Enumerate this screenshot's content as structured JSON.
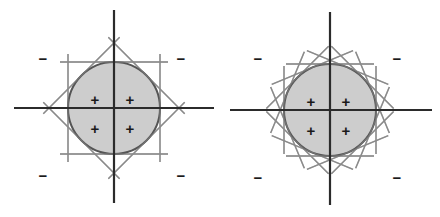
{
  "figure": {
    "background_color": "#ffffff",
    "panels": [
      {
        "id": "left-panel",
        "name": "eight-tangent-lines",
        "caption": "",
        "circle": {
          "cx": 114,
          "cy": 108,
          "r": 46,
          "fill_color": "#c9c9c9",
          "stroke_color": "#555555",
          "stroke_width": 2.0
        },
        "axes": {
          "color": "#2b2b2b",
          "width": 2.2,
          "horizontal": {
            "x1": 14,
            "y1": 108,
            "x2": 214,
            "y2": 108
          },
          "vertical": {
            "x1": 114,
            "y1": 10,
            "x2": 114,
            "y2": 203
          }
        },
        "tangent_lines": {
          "color": "#8a8a8a",
          "width": 1.4,
          "count": 8,
          "angles_deg": [
            0,
            45,
            90,
            135,
            180,
            225,
            270,
            315
          ],
          "half_length": 54,
          "description": "Four axis-aligned tangents forming a square plus four diagonal tangents forming a diamond."
        },
        "inside_marks": [
          {
            "label": "+",
            "x": 95,
            "y": 99
          },
          {
            "label": "+",
            "x": 130,
            "y": 99
          },
          {
            "label": "+",
            "x": 95,
            "y": 128
          },
          {
            "label": "+",
            "x": 130,
            "y": 128
          }
        ],
        "outside_marks": [
          {
            "label": "−",
            "x": 43,
            "y": 58
          },
          {
            "label": "−",
            "x": 181,
            "y": 58
          },
          {
            "label": "−",
            "x": 43,
            "y": 175
          },
          {
            "label": "−",
            "x": 181,
            "y": 175
          }
        ]
      },
      {
        "id": "right-panel",
        "name": "sixteen-tangent-lines",
        "caption": "",
        "circle": {
          "cx": 330,
          "cy": 110,
          "r": 46,
          "fill_color": "#c9c9c9",
          "stroke_color": "#555555",
          "stroke_width": 2.0
        },
        "axes": {
          "color": "#2b2b2b",
          "width": 2.2,
          "horizontal": {
            "x1": 230,
            "y1": 110,
            "x2": 432,
            "y2": 110
          },
          "vertical": {
            "x1": 330,
            "y1": 12,
            "x2": 330,
            "y2": 205
          }
        },
        "tangent_lines": {
          "color": "#8a8a8a",
          "width": 1.4,
          "count": 16,
          "angles_deg": [
            0,
            22.5,
            45,
            67.5,
            90,
            112.5,
            135,
            157.5,
            180,
            202.5,
            225,
            247.5,
            270,
            292.5,
            315,
            337.5
          ],
          "half_length": 44,
          "description": "Sixteen tangents at evenly spaced angles giving a closer polygonal approximation of the disk."
        },
        "inside_marks": [
          {
            "label": "+",
            "x": 311,
            "y": 101
          },
          {
            "label": "+",
            "x": 346,
            "y": 101
          },
          {
            "label": "+",
            "x": 311,
            "y": 130
          },
          {
            "label": "+",
            "x": 346,
            "y": 130
          }
        ],
        "outside_marks": [
          {
            "label": "−",
            "x": 258,
            "y": 58
          },
          {
            "label": "−",
            "x": 397,
            "y": 58
          },
          {
            "label": "−",
            "x": 258,
            "y": 177
          },
          {
            "label": "−",
            "x": 397,
            "y": 177
          }
        ]
      }
    ]
  }
}
